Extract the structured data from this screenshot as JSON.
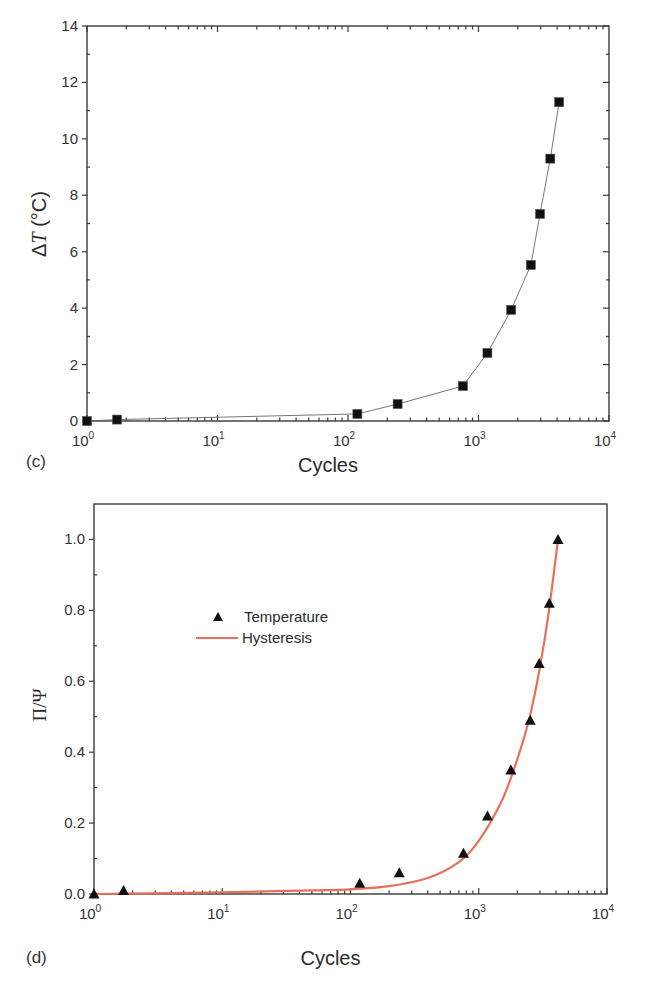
{
  "chart_data": [
    {
      "panel": "(c)",
      "type": "line",
      "title": "",
      "xlabel": "Cycles",
      "ylabel": "ΔT (°C)",
      "ylabel_parts": {
        "delta": "Δ",
        "var": "T",
        "unit": " (°C)"
      },
      "xscale": "log",
      "xlim": [
        1,
        10000
      ],
      "ylim": [
        0,
        14
      ],
      "x_ticks": [
        {
          "value": 1,
          "base": "10",
          "exp": "0"
        },
        {
          "value": 10,
          "base": "10",
          "exp": "1"
        },
        {
          "value": 100,
          "base": "10",
          "exp": "2"
        },
        {
          "value": 1000,
          "base": "10",
          "exp": "3"
        },
        {
          "value": 10000,
          "base": "10",
          "exp": "4"
        }
      ],
      "y_ticks": [
        0,
        2,
        4,
        6,
        8,
        10,
        12,
        14
      ],
      "grid": false,
      "series": [
        {
          "name": "ΔT",
          "marker": "square",
          "color": "#111111",
          "line_color": "#666666",
          "x": [
            1,
            1.7,
            118,
            240,
            760,
            1170,
            1780,
            2520,
            2960,
            3550,
            4150
          ],
          "y": [
            0.0,
            0.05,
            0.25,
            0.6,
            1.24,
            2.41,
            3.94,
            5.53,
            7.34,
            9.3,
            11.3
          ]
        }
      ]
    },
    {
      "panel": "(d)",
      "type": "scatter",
      "title": "",
      "xlabel": "Cycles",
      "ylabel": "Π/Ψ",
      "xscale": "log",
      "xlim": [
        1,
        10000
      ],
      "ylim": [
        0,
        1.1
      ],
      "x_ticks": [
        {
          "value": 1,
          "base": "10",
          "exp": "0"
        },
        {
          "value": 10,
          "base": "10",
          "exp": "1"
        },
        {
          "value": 100,
          "base": "10",
          "exp": "2"
        },
        {
          "value": 1000,
          "base": "10",
          "exp": "3"
        },
        {
          "value": 10000,
          "base": "10",
          "exp": "4"
        }
      ],
      "y_ticks": [
        "0.0",
        "0.2",
        "0.4",
        "0.6",
        "0.8",
        "1.0"
      ],
      "grid": false,
      "legend": {
        "position": "upper-left-inside",
        "entries": [
          {
            "label": "Temperature",
            "marker": "triangle",
            "color": "#111111"
          },
          {
            "label": "Hysteresis",
            "marker": "line",
            "color": "#e8705a"
          }
        ]
      },
      "series": [
        {
          "name": "Temperature",
          "marker": "triangle",
          "color": "#111111",
          "x": [
            1,
            1.7,
            118,
            240,
            760,
            1170,
            1780,
            2520,
            2960,
            3550,
            4150
          ],
          "y": [
            0.0,
            0.01,
            0.03,
            0.06,
            0.115,
            0.22,
            0.35,
            0.49,
            0.65,
            0.82,
            1.0
          ]
        },
        {
          "name": "Hysteresis",
          "marker": "line",
          "color": "#e8705a",
          "x": [
            1,
            10,
            50,
            100,
            200,
            400,
            700,
            1000,
            1500,
            2000,
            2500,
            3000,
            3500,
            4150
          ],
          "y": [
            0.0,
            0.005,
            0.01,
            0.013,
            0.022,
            0.045,
            0.09,
            0.15,
            0.26,
            0.38,
            0.5,
            0.64,
            0.79,
            1.0
          ]
        }
      ]
    }
  ]
}
